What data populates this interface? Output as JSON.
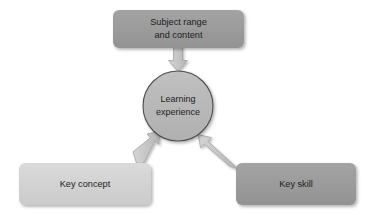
{
  "diagram": {
    "background_color": "#ffffff",
    "text_color": "#1c1c1c",
    "center": {
      "id": "learning-experience",
      "shape": "circle",
      "line_1": "Learning",
      "line_2": "experience",
      "fill_color": "#b9b9b9",
      "stroke_color": "#4d4d4d",
      "cx": 178,
      "cy": 106,
      "r": 35
    },
    "nodes": [
      {
        "id": "subject-range-and-content",
        "shape": "rounded-rectangle",
        "line_1": "Subject range",
        "line_2": "and content",
        "fill_color": "#9a9a9a",
        "x": 113,
        "y": 10,
        "width": 131,
        "height": 38,
        "position": "top"
      },
      {
        "id": "key-concept",
        "shape": "rounded-rectangle",
        "line_1": "Key concept",
        "line_2": "",
        "fill_color": "#d3d3d3",
        "x": 19,
        "y": 163,
        "width": 132,
        "height": 42,
        "position": "bottom-left"
      },
      {
        "id": "key-skill",
        "shape": "rounded-rectangle",
        "line_1": "Key skill",
        "line_2": "",
        "fill_color": "#9a9a9a",
        "x": 236,
        "y": 163,
        "width": 120,
        "height": 42,
        "position": "bottom-right"
      }
    ],
    "arrows": [
      {
        "id": "arrow-subject-range-to-center",
        "from": "subject-range-and-content",
        "to": "learning-experience",
        "direction": "down",
        "fill_color": "#c6c6c6",
        "stroke_color": "#9c9c9c"
      },
      {
        "id": "arrow-key-concept-to-center",
        "from": "key-concept",
        "to": "learning-experience",
        "direction": "up-right",
        "fill_color": "#c6c6c6",
        "stroke_color": "#9c9c9c"
      },
      {
        "id": "arrow-key-skill-to-center",
        "from": "key-skill",
        "to": "learning-experience",
        "direction": "up-left",
        "fill_color": "#c6c6c6",
        "stroke_color": "#9c9c9c"
      }
    ]
  }
}
